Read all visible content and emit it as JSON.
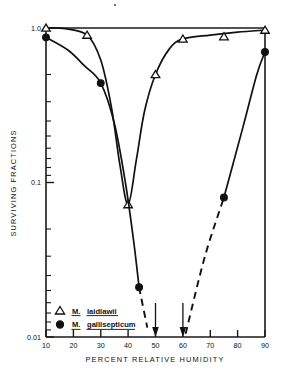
{
  "figure": {
    "background_color": "#ffffff",
    "ink_color": "#111111"
  },
  "axes": {
    "y_title": "SURVIVING FRACTIONS",
    "x_title": "PERCENT RELATIVE HUMIDITY",
    "y_tick_labels": [
      "1.0",
      "0.1",
      "0.01"
    ],
    "x_tick_labels": [
      "10",
      "20",
      "30",
      "40",
      "50",
      "60",
      "70",
      "80",
      "90"
    ]
  },
  "legend": {
    "items": [
      {
        "marker": "open-triangle-marker",
        "genus": "M.",
        "species": "laidlawii"
      },
      {
        "marker": "filled-circle-marker",
        "genus": "M.",
        "species": "gallisepticum"
      }
    ]
  },
  "annotations": {
    "arrows": [
      {
        "name": "arrow-marker-50",
        "x": 50
      },
      {
        "name": "arrow-marker-60",
        "x": 60
      }
    ]
  },
  "chart_data": {
    "type": "line",
    "title": "",
    "xlabel": "PERCENT RELATIVE HUMIDITY",
    "ylabel": "SURVIVING FRACTIONS",
    "xlim": [
      10,
      90
    ],
    "ylim": [
      0.01,
      1.0
    ],
    "yscale": "log",
    "grid": false,
    "legend_position": "bottom-left",
    "xticks": [
      10,
      20,
      30,
      40,
      50,
      60,
      70,
      80,
      90
    ],
    "yticks": [
      1.0,
      0.1,
      0.01
    ],
    "series": [
      {
        "name": "M. laidlawii",
        "marker": "open-triangle",
        "line": "solid",
        "points": [
          {
            "x": 10,
            "y": 1.0
          },
          {
            "x": 25,
            "y": 0.9
          },
          {
            "x": 40,
            "y": 0.072
          },
          {
            "x": 50,
            "y": 0.5
          },
          {
            "x": 60,
            "y": 0.85
          },
          {
            "x": 75,
            "y": 0.88
          },
          {
            "x": 90,
            "y": 0.97
          }
        ],
        "curve": [
          {
            "x": 10,
            "y": 1.0
          },
          {
            "x": 17,
            "y": 0.99
          },
          {
            "x": 25,
            "y": 0.9
          },
          {
            "x": 30,
            "y": 0.62
          },
          {
            "x": 34,
            "y": 0.3
          },
          {
            "x": 37,
            "y": 0.13
          },
          {
            "x": 40,
            "y": 0.072
          },
          {
            "x": 43,
            "y": 0.14
          },
          {
            "x": 46,
            "y": 0.29
          },
          {
            "x": 50,
            "y": 0.5
          },
          {
            "x": 55,
            "y": 0.73
          },
          {
            "x": 60,
            "y": 0.85
          },
          {
            "x": 70,
            "y": 0.9
          },
          {
            "x": 80,
            "y": 0.94
          },
          {
            "x": 90,
            "y": 0.97
          }
        ]
      },
      {
        "name": "M. gallisepticum",
        "marker": "filled-circle",
        "line": "solid-then-dashed",
        "points": [
          {
            "x": 10,
            "y": 0.87
          },
          {
            "x": 30,
            "y": 0.44
          },
          {
            "x": 44,
            "y": 0.021
          },
          {
            "x": 75,
            "y": 0.08
          },
          {
            "x": 90,
            "y": 0.7
          }
        ],
        "curve_solid_left": [
          {
            "x": 10,
            "y": 0.87
          },
          {
            "x": 18,
            "y": 0.72
          },
          {
            "x": 24,
            "y": 0.57
          },
          {
            "x": 30,
            "y": 0.44
          },
          {
            "x": 35,
            "y": 0.24
          },
          {
            "x": 39,
            "y": 0.1
          },
          {
            "x": 42,
            "y": 0.042
          },
          {
            "x": 44,
            "y": 0.021
          }
        ],
        "curve_dashed_left": [
          {
            "x": 44,
            "y": 0.021
          },
          {
            "x": 47,
            "y": 0.0115
          }
        ],
        "curve_dashed_right": [
          {
            "x": 61,
            "y": 0.0105
          },
          {
            "x": 68,
            "y": 0.033
          },
          {
            "x": 75,
            "y": 0.08
          }
        ],
        "curve_solid_right": [
          {
            "x": 75,
            "y": 0.08
          },
          {
            "x": 82,
            "y": 0.23
          },
          {
            "x": 87,
            "y": 0.5
          },
          {
            "x": 90,
            "y": 0.7
          }
        ]
      }
    ]
  }
}
